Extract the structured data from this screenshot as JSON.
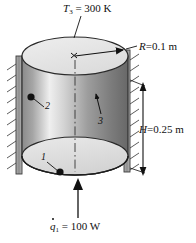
{
  "figure": {
    "background_color": "#ffffff",
    "line_color": "#111111"
  },
  "annotations": {
    "top_temperature": {
      "symbol": "T",
      "subscript": "3",
      "relation": "=",
      "value": "300",
      "unit": "K",
      "full_text": "T3 = 300 K"
    },
    "radius": {
      "symbol": "R",
      "relation": "=",
      "value": "0.1",
      "unit": "m",
      "full_text": "R = 0.1 m"
    },
    "height": {
      "symbol": "H",
      "relation": "=",
      "value": "0.25",
      "unit": "m",
      "full_text": "H = 0.25 m"
    },
    "heat_input": {
      "symbol": "q",
      "accent": "dot",
      "subscript": "1",
      "relation": "=",
      "value": "100",
      "unit": "W",
      "full_text": "q1 = 100 W"
    }
  },
  "surfaces": [
    {
      "id": "1",
      "label": "1",
      "description": "bottom disk surface"
    },
    {
      "id": "2",
      "label": "2",
      "description": "left lateral wall surface"
    },
    {
      "id": "3",
      "label": "3",
      "description": "right lateral wall surface"
    }
  ],
  "geometry": {
    "top_face_fill": "#e6e6e6",
    "bottom_face_fill": "#e0e0e0",
    "body_gradient": [
      "#8f8f8f",
      "#f2f2f2",
      "#9a9a9a",
      "#6e6e6e"
    ],
    "wall_fill": "#9c9c9c",
    "hatch_side_left": "insulated-wall-hatching",
    "hatch_side_right": "insulated-wall-hatching",
    "centerline_style": "dash-dot"
  }
}
